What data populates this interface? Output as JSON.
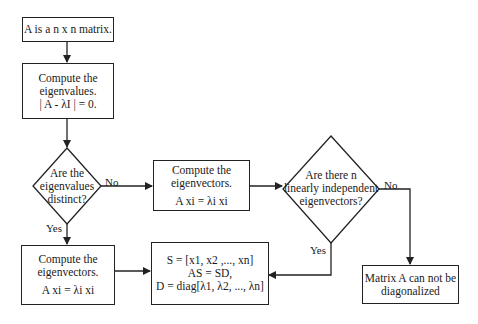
{
  "diagram": {
    "type": "flowchart",
    "nodes": {
      "start": {
        "lines": [
          "A is a n x n matrix."
        ]
      },
      "eigenvalues": {
        "lines": [
          "Compute the",
          "eigenvalues.",
          "| A - λI | = 0."
        ]
      },
      "distinct": {
        "lines": [
          "Are the",
          "eigenvalues",
          "distinct?"
        ]
      },
      "eigvec_no": {
        "lines": [
          "Compute the",
          "eigenvectors.",
          "A xi = λi xi"
        ]
      },
      "eigvec_yes": {
        "lines": [
          "Compute the",
          "eigenvectors.",
          "A xi = λi xi"
        ]
      },
      "independent": {
        "lines": [
          "Are there n",
          "linearly independent",
          "eigenvectors?"
        ]
      },
      "result": {
        "lines": [
          "S = [x1, x2 ,..., xn]",
          "AS = SD,",
          "D = diag[λ1, λ2, ..., λn]"
        ]
      },
      "fail": {
        "lines": [
          "Matrix A can not be",
          "diagonalized"
        ]
      }
    },
    "edge_labels": {
      "distinct_no": "No",
      "distinct_yes": "Yes",
      "independent_no": "No",
      "independent_yes": "Yes"
    },
    "colors": {
      "stroke": "#222222",
      "background": "#ffffff",
      "text": "#1a1a1a"
    }
  }
}
